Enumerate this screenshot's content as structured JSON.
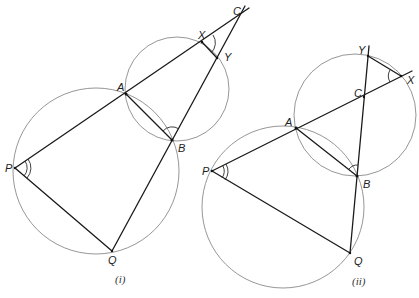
{
  "figure": {
    "panels": [
      {
        "caption": "(i)",
        "points": {
          "P": [
            15,
            168
          ],
          "Q": [
            112,
            251
          ],
          "A": [
            126,
            94
          ],
          "B": [
            172,
            140
          ],
          "X": [
            202,
            42
          ],
          "Y": [
            217,
            58
          ],
          "C": [
            241,
            12
          ]
        },
        "labels": {
          "P": "P",
          "Q": "Q",
          "A": "A",
          "B": "B",
          "X": "X",
          "Y": "Y",
          "C": "C"
        },
        "circles": [
          {
            "name": "large-circle",
            "cx": 96,
            "cy": 171,
            "r": 83
          },
          {
            "name": "small-circle",
            "cx": 177,
            "cy": 89,
            "r": 52
          }
        ]
      },
      {
        "caption": "(ii)",
        "points": {
          "P": [
            212,
            171
          ],
          "Q": [
            350,
            253
          ],
          "A": [
            296,
            128
          ],
          "B": [
            357,
            176
          ],
          "X": [
            401,
            76
          ],
          "Y": [
            368,
            56
          ],
          "C": [
            364,
            97
          ]
        },
        "labels": {
          "P": "P",
          "Q": "Q",
          "A": "A",
          "B": "B",
          "X": "X",
          "Y": "Y",
          "C": "C"
        },
        "circles": [
          {
            "name": "large-circle",
            "cx": 283,
            "cy": 207,
            "r": 81
          },
          {
            "name": "small-circle",
            "cx": 355,
            "cy": 115,
            "r": 61
          }
        ]
      }
    ],
    "colors": {
      "line": "#1a1a1a",
      "circle": "#8a8a8a",
      "background": "#ffffff"
    }
  }
}
